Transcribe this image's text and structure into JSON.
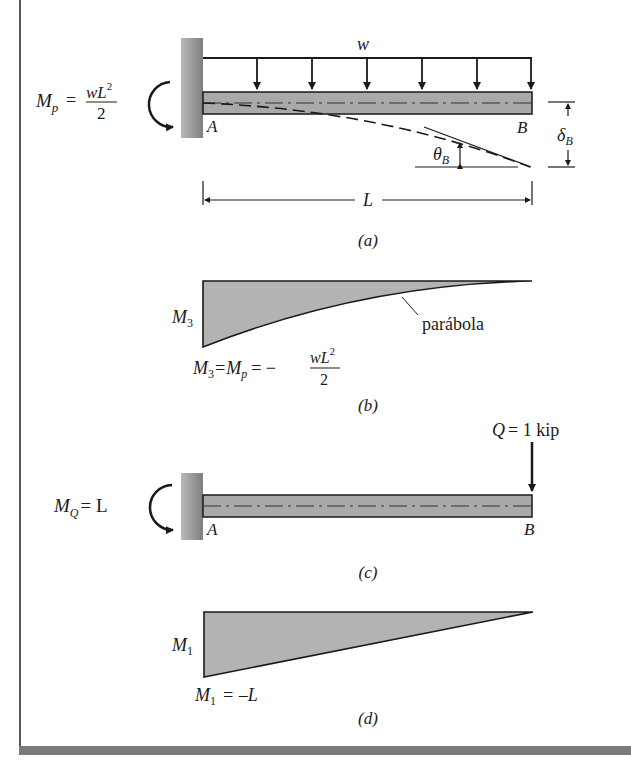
{
  "figure": {
    "panels": {
      "a": {
        "caption": "(a)",
        "load_label": "w",
        "support_label": "A",
        "end_label": "B",
        "moment": {
          "symbol": "M",
          "sub": "p",
          "eq": "=",
          "num_var": "wL",
          "num_exp": "2",
          "den": "2"
        },
        "rotation_label": {
          "symbol": "θ",
          "sub": "B"
        },
        "deflection_label": {
          "symbol": "δ",
          "sub": "B"
        },
        "span_label": "L"
      },
      "b": {
        "caption": "(b)",
        "diagram_label": {
          "symbol": "M",
          "sub": "3"
        },
        "curve_note": "parábola",
        "equation": {
          "lhs": "M",
          "lhs_sub": "3",
          "mid": "=M",
          "mid_sub": "p",
          "eq": "= −",
          "num_var": "wL",
          "num_exp": "2",
          "den": "2"
        }
      },
      "c": {
        "caption": "(c)",
        "support_label": "A",
        "end_label": "B",
        "point_load": {
          "symbol": "Q",
          "text": "= 1 kip"
        },
        "moment": {
          "symbol": "M",
          "sub": "Q",
          "text": "= L"
        }
      },
      "d": {
        "caption": "(d)",
        "diagram_label": {
          "symbol": "M",
          "sub": "1"
        },
        "equation": {
          "lhs": "M",
          "lhs_sub": "1",
          "rhs": "= –L"
        }
      }
    },
    "colors": {
      "beam_fill": "#a9a9a9",
      "wall_fill": "#9a9a9a",
      "diagram_fill": "#b3b3b3",
      "ink": "#1a1a1a"
    }
  }
}
